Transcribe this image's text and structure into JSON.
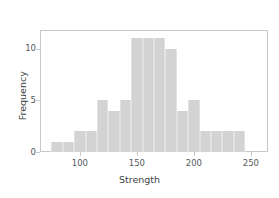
{
  "chart_data": {
    "type": "bar",
    "subtype": "histogram",
    "title": "",
    "xlabel": "Strength",
    "ylabel": "Frequency",
    "bin_width": 10,
    "bin_start": 75,
    "bin_end": 245,
    "categories": [
      "75-85",
      "85-95",
      "95-105",
      "105-115",
      "115-125",
      "125-135",
      "135-145",
      "145-155",
      "155-165",
      "165-175",
      "175-185",
      "185-195",
      "195-205",
      "205-215",
      "215-225",
      "225-235",
      "235-245"
    ],
    "bin_edges": [
      75,
      85,
      95,
      105,
      115,
      125,
      135,
      145,
      155,
      165,
      175,
      185,
      195,
      205,
      215,
      225,
      235,
      245
    ],
    "bin_centers": [
      80,
      90,
      100,
      110,
      120,
      130,
      140,
      150,
      160,
      170,
      180,
      190,
      200,
      210,
      220,
      230,
      240
    ],
    "values": [
      1,
      1,
      2,
      2,
      5,
      4,
      5,
      11,
      11,
      11,
      10,
      4,
      5,
      2,
      2,
      2,
      2
    ],
    "xlim": [
      65,
      265
    ],
    "ylim": [
      0,
      11.8
    ],
    "xticks": [
      100,
      150,
      200,
      250
    ],
    "xtick_labels": [
      "100",
      "150",
      "200",
      "250"
    ],
    "yticks": [
      0,
      5,
      10
    ],
    "ytick_labels": [
      "0",
      "5",
      "10"
    ],
    "grid": false,
    "legend": false,
    "bar_color": "#d3d3d3",
    "bar_edge_color": "#e2e2e2",
    "axis_color": "#c8c8c8",
    "tick_label_color": "#55585c",
    "axis_label_color": "#3c3f42",
    "background_color": "#ffffff"
  }
}
